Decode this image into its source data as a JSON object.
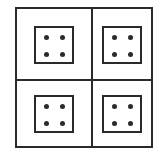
{
  "diagram": {
    "grid": {
      "rows": 2,
      "cols": 2
    },
    "cells": [
      {
        "position": "top-left",
        "dots": 4
      },
      {
        "position": "top-right",
        "dots": 4
      },
      {
        "position": "bottom-left",
        "dots": 4
      },
      {
        "position": "bottom-right",
        "dots": 4
      }
    ],
    "colors": {
      "line": "#2a2a2a",
      "background": "#ffffff"
    }
  }
}
